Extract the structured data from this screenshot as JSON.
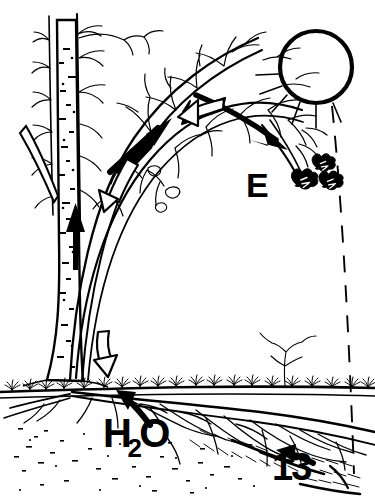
{
  "figure": {
    "kind": "line-drawing",
    "medium": "black-and-white pen-and-ink scientific illustration",
    "background_color": "#ffffff",
    "ink_color": "#000000",
    "width": 375,
    "height": 501
  },
  "labels": {
    "evaporation": "E",
    "water": "H",
    "water_subscript": "2",
    "water_tail": "O",
    "figure_number": "13",
    "caption_faint": ""
  },
  "elements": {
    "sun": {
      "name": "sun",
      "shape": "open circle with thick outline",
      "center_x": 316,
      "center_y": 67,
      "radius": 36,
      "stroke_width": 4,
      "rays": "short dashed radiating strokes on lower-left quadrant"
    },
    "sunbeam": {
      "name": "sunbeam-dashed-line",
      "description": "long dashed line descending from sun to lower right",
      "from_x": 330,
      "from_y": 104,
      "to_x": 352,
      "to_y": 470
    },
    "trunk": {
      "name": "birch-trunk",
      "description": "vertical tapering birch trunk with lenticel speckle markings",
      "base_x": 62,
      "base_y": 382,
      "top_y": 20
    },
    "ground_line": {
      "name": "ground-surface",
      "y": 382,
      "description": "horizontal soil surface with grass tufts"
    },
    "roots": {
      "name": "root-system",
      "description": "dense spreading lateral root network beneath the soil line"
    },
    "arched_branch": {
      "name": "arching-branch",
      "description": "large branch arcing up from trunk base and over to the right, bearing twigs and leaves"
    },
    "leaves": {
      "name": "leaf-clusters",
      "count": 3,
      "description": "small lobed leaf clusters at the drooping branch tip near label E"
    }
  },
  "arrows": [
    {
      "name": "trunk-uptake-arrow",
      "style": "solid",
      "direction": "up",
      "meaning": "water rising in trunk"
    },
    {
      "name": "branch-flow-arrow-lower",
      "style": "solid",
      "direction": "up-right",
      "meaning": "sap flow along branch"
    },
    {
      "name": "branch-flow-arrow-upper",
      "style": "solid",
      "direction": "down-right",
      "meaning": "flow toward leaf tip"
    },
    {
      "name": "hollow-arrow-branch-lower",
      "style": "hollow-outline",
      "direction": "down-left",
      "meaning": "return / pressure direction"
    },
    {
      "name": "hollow-arrow-branch-upper",
      "style": "hollow-outline",
      "direction": "left",
      "meaning": "return / pressure direction"
    },
    {
      "name": "hollow-arrow-to-soil",
      "style": "hollow-outline",
      "direction": "down",
      "meaning": "stemflow into soil"
    },
    {
      "name": "h2o-uptake-arrow",
      "style": "solid",
      "direction": "up-left",
      "meaning": "water uptake by roots"
    },
    {
      "name": "fignum-arrow",
      "style": "solid",
      "direction": "up-left",
      "meaning": "pointer to root zone"
    }
  ],
  "colors": {
    "ink": "#000000",
    "paper": "#ffffff",
    "faint_caption": "#b9b9b9"
  }
}
